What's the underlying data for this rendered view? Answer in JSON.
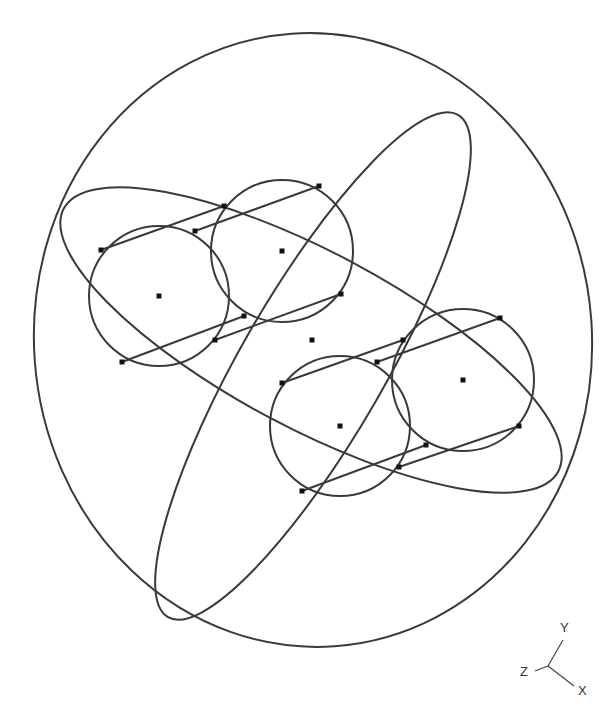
{
  "viewport": {
    "background": "#ffffff",
    "stroke_color": "#3a3a3a",
    "point_color": "#111111"
  },
  "triad": {
    "y_label": "Y",
    "z_label": "Z",
    "x_label": "X"
  },
  "geometry": {
    "outer_sphere": {
      "cx": 313,
      "cy": 340,
      "rx": 279,
      "ry": 307,
      "rot": -4
    },
    "ring_a": {
      "cx": 313,
      "cy": 366,
      "rx": 290,
      "ry": 72,
      "rot": -60
    },
    "ring_b": {
      "cx": 311,
      "cy": 340,
      "rx": 280,
      "ry": 88,
      "rot": 28
    },
    "circles": [
      {
        "cx": 159,
        "cy": 296,
        "r": 70
      },
      {
        "cx": 282,
        "cy": 251,
        "r": 71
      },
      {
        "cx": 340,
        "cy": 426,
        "r": 70
      },
      {
        "cx": 463,
        "cy": 380,
        "r": 71
      }
    ],
    "center_point": {
      "x": 312,
      "y": 340
    },
    "tangent_lines": [
      {
        "x1": 101,
        "y1": 250,
        "x2": 224,
        "y2": 206
      },
      {
        "x1": 195,
        "y1": 231,
        "x2": 319,
        "y2": 186
      },
      {
        "x1": 122,
        "y1": 362,
        "x2": 244,
        "y2": 316
      },
      {
        "x1": 215,
        "y1": 340,
        "x2": 341,
        "y2": 294
      },
      {
        "x1": 282,
        "y1": 383,
        "x2": 403,
        "y2": 340
      },
      {
        "x1": 377,
        "y1": 362,
        "x2": 500,
        "y2": 318
      },
      {
        "x1": 302,
        "y1": 491,
        "x2": 426,
        "y2": 445
      },
      {
        "x1": 399,
        "y1": 467,
        "x2": 519,
        "y2": 426
      }
    ],
    "points": [
      {
        "x": 101,
        "y": 250
      },
      {
        "x": 224,
        "y": 206
      },
      {
        "x": 195,
        "y": 231
      },
      {
        "x": 319,
        "y": 186
      },
      {
        "x": 122,
        "y": 362
      },
      {
        "x": 244,
        "y": 316
      },
      {
        "x": 215,
        "y": 340
      },
      {
        "x": 341,
        "y": 294
      },
      {
        "x": 282,
        "y": 383
      },
      {
        "x": 403,
        "y": 340
      },
      {
        "x": 377,
        "y": 362
      },
      {
        "x": 500,
        "y": 318
      },
      {
        "x": 302,
        "y": 491
      },
      {
        "x": 426,
        "y": 445
      },
      {
        "x": 399,
        "y": 467
      },
      {
        "x": 519,
        "y": 426
      },
      {
        "x": 159,
        "y": 296
      },
      {
        "x": 282,
        "y": 251
      },
      {
        "x": 340,
        "y": 426
      },
      {
        "x": 463,
        "y": 380
      },
      {
        "x": 312,
        "y": 340
      }
    ]
  }
}
